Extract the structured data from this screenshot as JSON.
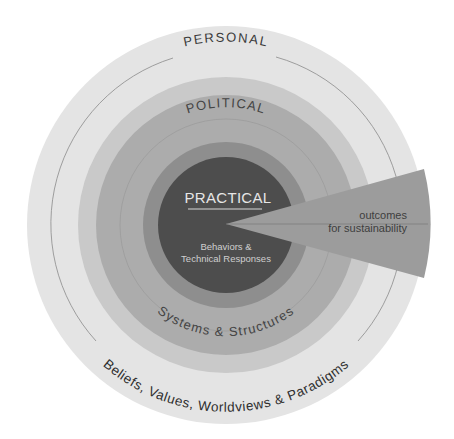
{
  "diagram": {
    "center": {
      "title": "PRACTICAL",
      "subtitle_line1": "Behaviors &",
      "subtitle_line2": "Technical Responses"
    },
    "middle_ring": {
      "title": "POLITICAL",
      "subtitle": "Systems & Structures"
    },
    "outer_ring": {
      "title": "PERSONAL",
      "subtitle": "Beliefs, Values, Worldviews & Paradigms"
    },
    "wedge": {
      "line1": "outcomes",
      "line2": "for sustainability"
    },
    "colors": {
      "outer_ring": "#e4e4e4",
      "political_outer_band": "#c9c9c9",
      "political_inner_band": "#acacac",
      "practical_ring": "#8e8e8e",
      "practical_core": "#4d4d4d",
      "wedge": "#9c9c9c",
      "divider_line": "#8a8a8a"
    }
  }
}
